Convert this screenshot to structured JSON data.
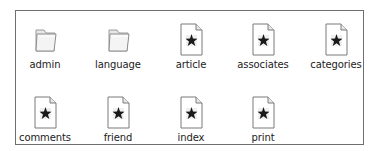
{
  "window": {
    "view": "icon-view"
  },
  "colors": {
    "border": "#6f6f6f",
    "label_text": "#222222",
    "folder_fill": "#efefef",
    "folder_stroke": "#9a9a9a",
    "doc_stroke": "#7a7a7a",
    "star": "#1a1a1a"
  },
  "items": [
    {
      "label": "admin",
      "type": "folder",
      "icon": "folder-icon"
    },
    {
      "label": "language",
      "type": "folder",
      "icon": "folder-icon"
    },
    {
      "label": "article",
      "type": "file",
      "icon": "php-file-icon"
    },
    {
      "label": "associates",
      "type": "file",
      "icon": "php-file-icon"
    },
    {
      "label": "categories",
      "type": "file",
      "icon": "php-file-icon"
    },
    {
      "label": "comments",
      "type": "file",
      "icon": "php-file-icon"
    },
    {
      "label": "friend",
      "type": "file",
      "icon": "php-file-icon"
    },
    {
      "label": "index",
      "type": "file",
      "icon": "php-file-icon"
    },
    {
      "label": "print",
      "type": "file",
      "icon": "php-file-icon"
    }
  ]
}
